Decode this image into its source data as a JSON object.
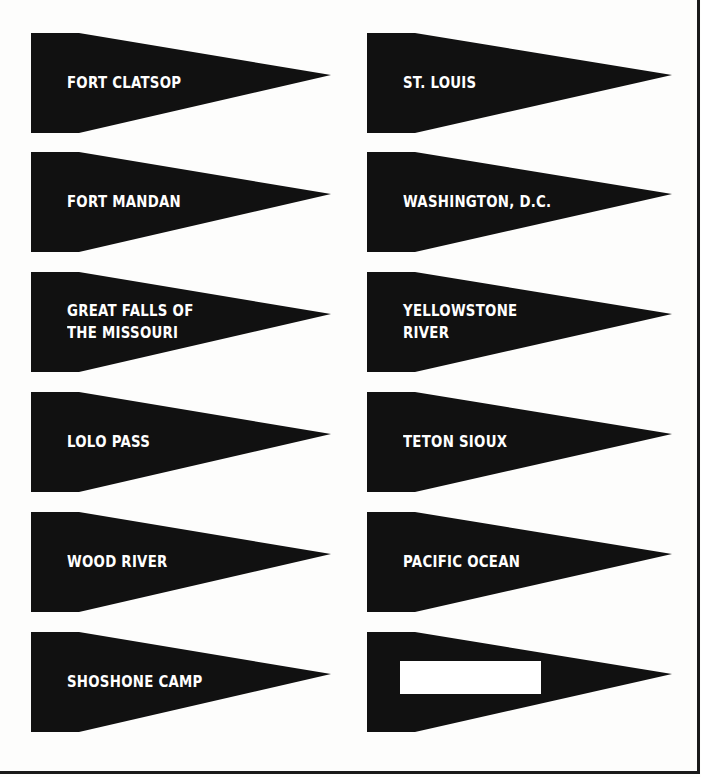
{
  "worksheet": {
    "colors": {
      "pennant_fill": "#111111",
      "label_text": "#ffffff",
      "background": "#fdfdfc",
      "border": "#1a1a1a"
    },
    "pennants_left": [
      {
        "label": "FORT CLATSOP"
      },
      {
        "label": "FORT MANDAN"
      },
      {
        "label": "GREAT FALLS OF THE MISSOURI",
        "lines": [
          "GREAT FALLS OF",
          "THE MISSOURI"
        ]
      },
      {
        "label": "LOLO PASS"
      },
      {
        "label": "WOOD RIVER"
      },
      {
        "label": "SHOSHONE CAMP"
      }
    ],
    "pennants_right": [
      {
        "label": "ST. LOUIS"
      },
      {
        "label": "WASHINGTON, D.C."
      },
      {
        "label": "YELLOWSTONE RIVER",
        "lines": [
          "YELLOWSTONE",
          "RIVER"
        ]
      },
      {
        "label": "TETON SIOUX"
      },
      {
        "label": "PACIFIC OCEAN"
      },
      {
        "label": "",
        "blank": true
      }
    ]
  }
}
